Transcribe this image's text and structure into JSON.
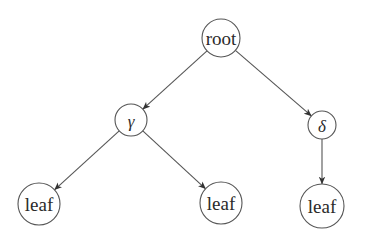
{
  "diagram": {
    "type": "tree",
    "colors": {
      "background": "#ffffff",
      "stroke": "#555555",
      "text": "#2a2a2a"
    },
    "nodes": [
      {
        "id": "root",
        "label": "root",
        "x": 221,
        "y": 38,
        "r": 19,
        "style": "word"
      },
      {
        "id": "gamma",
        "label": "γ",
        "x": 131,
        "y": 120,
        "r": 16,
        "style": "greek"
      },
      {
        "id": "delta",
        "label": "δ",
        "x": 322,
        "y": 125,
        "r": 14,
        "style": "greek"
      },
      {
        "id": "leaf1",
        "label": "leaf",
        "x": 39,
        "y": 204,
        "r": 21,
        "style": "word"
      },
      {
        "id": "leaf2",
        "label": "leaf",
        "x": 221,
        "y": 203,
        "r": 21,
        "style": "word"
      },
      {
        "id": "leaf3",
        "label": "leaf",
        "x": 322,
        "y": 206,
        "r": 22,
        "style": "word"
      }
    ],
    "edges": [
      {
        "from": "root",
        "to": "gamma"
      },
      {
        "from": "root",
        "to": "delta"
      },
      {
        "from": "gamma",
        "to": "leaf1"
      },
      {
        "from": "gamma",
        "to": "leaf2"
      },
      {
        "from": "delta",
        "to": "leaf3"
      }
    ]
  }
}
